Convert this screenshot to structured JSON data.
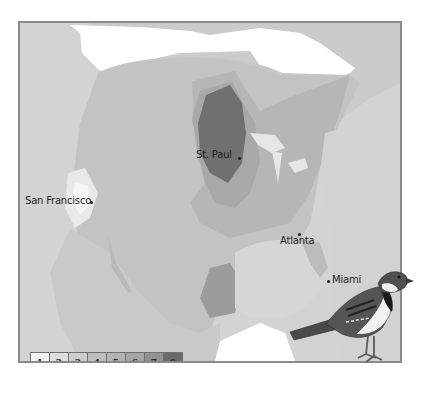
{
  "map": {
    "title": "",
    "region": "North America",
    "cities": [
      {
        "name": "St. Paul",
        "label": "St. Paul"
      },
      {
        "name": "San Francisco",
        "label": "San Francisco"
      },
      {
        "name": "Atlanta",
        "label": "Atlanta"
      },
      {
        "name": "Miami",
        "label": "Miami"
      }
    ],
    "legend": {
      "items": [
        {
          "label": "1",
          "color": "#f3f3f3"
        },
        {
          "label": "2",
          "color": "#dedede"
        },
        {
          "label": "3",
          "color": "#cdcdcd"
        },
        {
          "label": "4",
          "color": "#bdbdbd"
        },
        {
          "label": "5",
          "color": "#b3b3b3"
        },
        {
          "label": "6",
          "color": "#a5a5a5"
        },
        {
          "label": "7",
          "color": "#929292"
        },
        {
          "label": "8",
          "color": "#6a6a6a"
        }
      ]
    },
    "colors": {
      "background": "#ffffff",
      "ocean": "#d6d6d6",
      "frame_border": "#8a8a8a",
      "unshaded_land": "#ffffff",
      "outside_land": "#cfcfcf"
    },
    "illustration": "sparrow-bird"
  }
}
